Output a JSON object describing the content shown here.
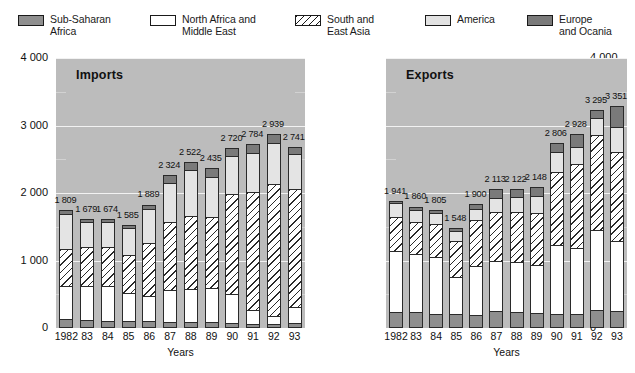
{
  "legend": {
    "items": [
      {
        "name": "sub-saharan-africa",
        "label": "Sub-Saharan\nAfrica",
        "swatch": "sw-ssa",
        "color": "#8f8f8f"
      },
      {
        "name": "north-africa-middle-east",
        "label": "North Africa and\nMiddle East",
        "swatch": "sw-nam",
        "color": "#ffffff"
      },
      {
        "name": "south-east-asia",
        "label": "South and\nEast Asia",
        "swatch": "sw-sea",
        "color": "#ffffff"
      },
      {
        "name": "america",
        "label": "America",
        "swatch": "sw-ame",
        "color": "#e2e2e2"
      },
      {
        "name": "europe-ocania",
        "label": "Europe\nand Ocania",
        "swatch": "sw-eur",
        "color": "#7a7a7a"
      }
    ]
  },
  "chart_data": {
    "type": "bar",
    "subtype": "stacked",
    "title": "",
    "panels": [
      {
        "name": "imports",
        "title": "Imports",
        "xlabel": "Years",
        "ylabel": "",
        "ylim": [
          0,
          4000
        ],
        "yticks": [
          "0",
          "1 000",
          "2 000",
          "3 000",
          "4 000"
        ],
        "ytick_values": [
          0,
          1000,
          2000,
          3000,
          4000
        ],
        "minor_ticks": [
          500,
          1500,
          2500,
          3500
        ],
        "categories": [
          "1982",
          "83",
          "84",
          "85",
          "86",
          "87",
          "88",
          "89",
          "90",
          "91",
          "92",
          "93"
        ],
        "totals": [
          1809,
          1679,
          1674,
          1585,
          1889,
          2324,
          2522,
          2435,
          2720,
          2784,
          2939,
          2741
        ],
        "total_labels": [
          "1 809",
          "1 679",
          "1 674",
          "1 585",
          "1 889",
          "2 324",
          "2 522",
          "2 435",
          "2 720",
          "2 784",
          "2 939",
          "2 741"
        ],
        "series": [
          {
            "name": "Sub-Saharan Africa",
            "key": "ssa",
            "class": "seg-ssa",
            "values": [
              130,
              120,
              110,
              105,
              100,
              95,
              95,
              90,
              70,
              60,
              55,
              80
            ]
          },
          {
            "name": "North Africa and Middle East",
            "key": "nam",
            "class": "seg-nam",
            "values": [
              500,
              520,
              530,
              430,
              395,
              490,
              500,
              520,
              450,
              215,
              145,
              245
            ]
          },
          {
            "name": "South and East Asia",
            "key": "sea",
            "class": "seg-sea",
            "values": [
              565,
              595,
              585,
              575,
              790,
              1010,
              1090,
              1065,
              1500,
              1765,
              1965,
              1765
            ]
          },
          {
            "name": "America",
            "key": "ame",
            "class": "seg-ame",
            "values": [
              545,
              385,
              385,
              410,
              520,
              600,
              695,
              605,
              570,
              605,
              615,
              540
            ]
          },
          {
            "name": "Europe and Ocania",
            "key": "eur",
            "class": "seg-eur",
            "values": [
              69,
              59,
              64,
              65,
              84,
              129,
              142,
              155,
              130,
              139,
              159,
              111
            ]
          }
        ]
      },
      {
        "name": "exports",
        "title": "Exports",
        "xlabel": "Years",
        "ylabel": "",
        "ylim": [
          0,
          4000
        ],
        "yticks": [
          "0",
          "1 000",
          "2 000",
          "3 000",
          "4 000"
        ],
        "ytick_values": [
          0,
          1000,
          2000,
          3000,
          4000
        ],
        "minor_ticks": [
          500,
          1500,
          2500,
          3500
        ],
        "categories": [
          "1982",
          "83",
          "84",
          "85",
          "86",
          "87",
          "88",
          "89",
          "90",
          "91",
          "92",
          "93"
        ],
        "totals": [
          1941,
          1860,
          1805,
          1548,
          1900,
          2113,
          2122,
          2148,
          2806,
          2928,
          3295,
          3351
        ],
        "total_labels": [
          "1 941",
          "1 860",
          "1 805",
          "1 548",
          "1 900",
          "2 113",
          "2 122",
          "2 148",
          "2 806",
          "2 928",
          "3 295",
          "3 351"
        ],
        "series": [
          {
            "name": "Sub-Saharan Africa",
            "key": "ssa",
            "class": "seg-ssa",
            "values": [
              240,
              230,
              215,
              210,
              200,
              245,
              240,
              220,
              215,
              205,
              265,
              250
            ]
          },
          {
            "name": "North Africa and Middle East",
            "key": "nam",
            "class": "seg-nam",
            "values": [
              920,
              880,
              855,
              560,
              730,
              760,
              750,
              730,
              1030,
              1000,
              1195,
              1050
            ]
          },
          {
            "name": "South and East Asia",
            "key": "sea",
            "class": "seg-sea",
            "values": [
              515,
              495,
              495,
              545,
              700,
              745,
              760,
              790,
              1100,
              1250,
              1430,
              1340
            ]
          },
          {
            "name": "America",
            "key": "ame",
            "class": "seg-ame",
            "values": [
              215,
              190,
              180,
              160,
              180,
              220,
              230,
              255,
              300,
              275,
              265,
              380
            ]
          },
          {
            "name": "Europe and Ocania",
            "key": "eur",
            "class": "seg-eur",
            "values": [
              51,
              65,
              60,
              73,
              90,
              143,
              142,
              153,
              161,
              198,
              140,
              331
            ]
          }
        ]
      }
    ]
  }
}
